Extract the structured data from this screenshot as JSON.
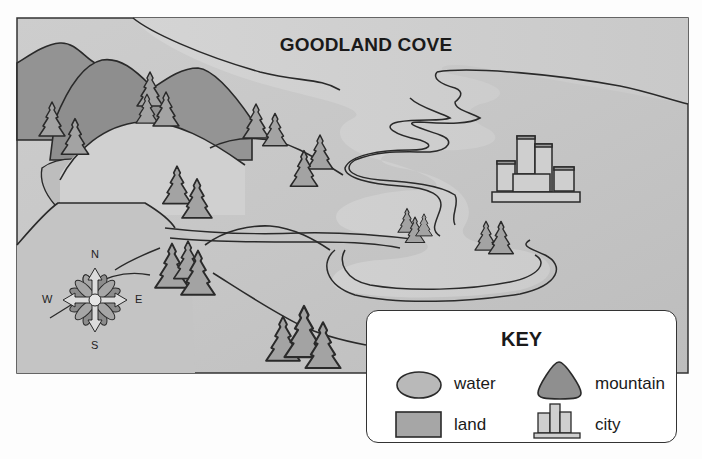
{
  "map": {
    "title": "GOODLAND COVE",
    "features": [
      "mountains",
      "hills",
      "river",
      "lake",
      "trees",
      "city",
      "compass rose"
    ]
  },
  "compass": {
    "north": "N",
    "south": "S",
    "east": "E",
    "west": "W"
  },
  "key": {
    "title": "KEY",
    "items": [
      {
        "label": "water",
        "symbol": "oval",
        "color": "#b9b9b9"
      },
      {
        "label": "mountain",
        "symbol": "rounded-triangle",
        "color": "#8f8f8f"
      },
      {
        "label": "land",
        "symbol": "rectangle",
        "color": "#a6a6a6"
      },
      {
        "label": "city",
        "symbol": "buildings",
        "color": "#c4c4c4"
      }
    ]
  },
  "colors": {
    "outline": "#2a2a2a",
    "background_land": "#c8c8c8",
    "water": "#bdbdbd",
    "mountain": "#959595",
    "hill": "#cfcfcf",
    "tree": "#a3a3a3"
  }
}
